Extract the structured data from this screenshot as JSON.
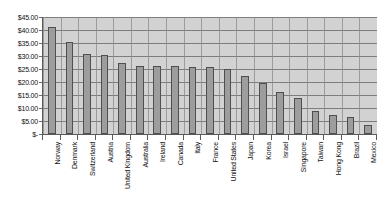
{
  "chart_data": {
    "type": "bar",
    "title": "",
    "subtitle": "",
    "xlabel": "",
    "ylabel": "",
    "ylim": [
      0,
      45
    ],
    "grid": true,
    "legend": false,
    "y_tick_labels": [
      "$45.00",
      "$40.00",
      "$35.00",
      "$30.00",
      "$25.00",
      "$20.00",
      "$15.00",
      "$10.00",
      "$5.00",
      "$-"
    ],
    "y_tick_values": [
      45,
      40,
      35,
      30,
      25,
      20,
      15,
      10,
      5,
      0
    ],
    "categories": [
      "Norway",
      "Denmark",
      "Switzerland",
      "Austria",
      "United Kingdom",
      "Australia",
      "Ireland",
      "Canada",
      "Italy",
      "France",
      "United States",
      "Japan",
      "Korea",
      "Israel",
      "Singapore",
      "Taiwan",
      "Hong Kong",
      "Brazil",
      "Mexico"
    ],
    "values": [
      41.0,
      35.3,
      30.6,
      30.2,
      27.2,
      26.2,
      26.1,
      26.0,
      25.9,
      25.8,
      24.9,
      22.4,
      19.8,
      16.3,
      13.8,
      9.0,
      7.2,
      6.4,
      3.6
    ],
    "colors": {
      "bar_fill": "#9d9d9d",
      "bar_outline": "#4f4f4f",
      "plot_background": "#d2d2d2",
      "gridline": "#7d7d7d",
      "axis": "#5a5a5a",
      "text": "#111111",
      "canvas_background": "#ffffff"
    }
  }
}
